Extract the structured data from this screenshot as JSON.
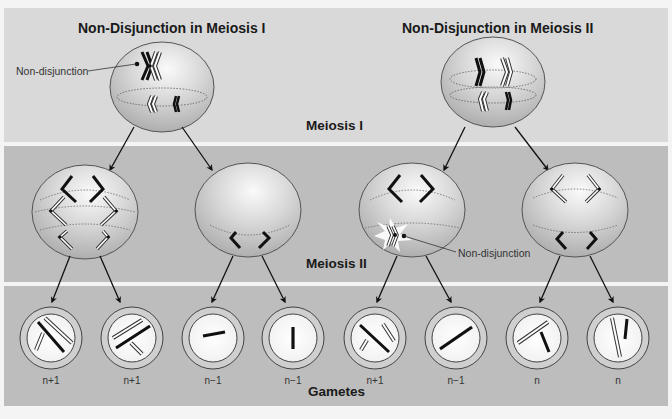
{
  "titles": {
    "left": "Non-Disjunction in Meiosis I",
    "right": "Non-Disjunction in Meiosis II"
  },
  "stages": {
    "meiosis_1": "Meiosis I",
    "meiosis_2": "Meiosis II",
    "gametes": "Gametes"
  },
  "annotations": {
    "nondisjunction_top": "Non-disjunction",
    "nondisjunction_mid": "Non-disjunction"
  },
  "gametes": [
    {
      "label": "n+1"
    },
    {
      "label": "n+1"
    },
    {
      "label": "n−1"
    },
    {
      "label": "n−1"
    },
    {
      "label": "n+1"
    },
    {
      "label": "n−1"
    },
    {
      "label": "n"
    },
    {
      "label": "n"
    }
  ],
  "colors": {
    "top_band": "#d9d9d9",
    "lower_bands": "#bdbdbd",
    "cell_fill": "#d6d6d6",
    "chromosome_dark": "#111111",
    "chromosome_light": "#ffffff"
  }
}
